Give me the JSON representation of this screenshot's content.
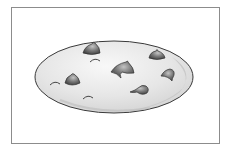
{
  "image": {
    "subject": "chocolate chip cookie clip art",
    "caption": "Cookie"
  },
  "colors": {
    "frame_border": "#8c8c8c",
    "background": "#ffffff",
    "cookie_fill_light": "#f4f4f4",
    "cookie_fill_mid": "#d9d9d9",
    "cookie_rim_shadow": "#c8c8c8",
    "cookie_outline": "#3a3a3a",
    "chip_dark": "#4a4a4a",
    "chip_light": "#b5b5b5"
  },
  "cookie": {
    "center": [
      114,
      77
    ],
    "rx": 79,
    "ry": 36,
    "chips": [
      {
        "id": "chip-1",
        "x": 92,
        "y": 49
      },
      {
        "id": "chip-2",
        "x": 122,
        "y": 68
      },
      {
        "id": "chip-3",
        "x": 71,
        "y": 80
      },
      {
        "id": "chip-4",
        "x": 156,
        "y": 55
      },
      {
        "id": "chip-5",
        "x": 168,
        "y": 73
      },
      {
        "id": "chip-6",
        "x": 142,
        "y": 90
      }
    ],
    "crumb_marks": [
      {
        "id": "mark-1",
        "x": 95,
        "y": 60
      },
      {
        "id": "mark-2",
        "x": 55,
        "y": 83
      },
      {
        "id": "mark-3",
        "x": 88,
        "y": 97
      }
    ]
  }
}
